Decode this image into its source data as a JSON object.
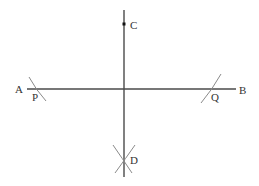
{
  "diagram": {
    "colors": {
      "line": "#4a4a4a",
      "arc": "#8a8a8a",
      "label": "#333333",
      "background": "#ffffff"
    },
    "line_ab": {
      "from": "A",
      "to": "B"
    },
    "perpendicular": {
      "through": [
        "C",
        "D"
      ]
    },
    "points": {
      "A": {
        "label": "A"
      },
      "B": {
        "label": "B"
      },
      "C": {
        "label": "C"
      },
      "D": {
        "label": "D"
      },
      "P": {
        "label": "P"
      },
      "Q": {
        "label": "Q"
      }
    }
  }
}
